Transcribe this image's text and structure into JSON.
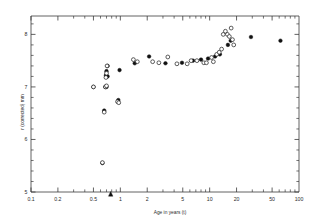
{
  "chart_data": {
    "type": "scatter",
    "title": "",
    "xlabel": "Age in years (t)",
    "ylabel": "r (corrected) mm",
    "xscale": "log",
    "yscale": "linear",
    "xlim": [
      0.1,
      100
    ],
    "ylim": [
      5,
      8.35
    ],
    "grid": false,
    "legend": "none",
    "xticks_major": [
      0.1,
      0.2,
      0.5,
      1,
      2,
      5,
      10,
      20,
      50,
      100
    ],
    "xtick_labels": [
      "0.1",
      "0.2",
      "0.5",
      "1",
      "2",
      "5",
      "10",
      "20",
      "50",
      "100"
    ],
    "yticks_major": [
      5,
      6,
      7,
      8
    ],
    "ytick_labels": [
      "5",
      "6",
      "7",
      "8"
    ],
    "annotations": [
      {
        "name": "axis-arrow-marker",
        "type": "triangle",
        "x": 0.78,
        "y": 5.0,
        "note": "triangle marker on x-axis"
      }
    ],
    "series": [
      {
        "name": "filled",
        "marker": "filled-circle",
        "color": "#111111",
        "points": [
          [
            0.5,
            7.0
          ],
          [
            0.63,
            5.55
          ],
          [
            0.66,
            6.55
          ],
          [
            0.68,
            7.0
          ],
          [
            0.69,
            7.22
          ],
          [
            0.7,
            7.0
          ],
          [
            0.7,
            7.3
          ],
          [
            0.72,
            7.4
          ],
          [
            0.72,
            7.2
          ],
          [
            0.95,
            6.75
          ],
          [
            0.98,
            7.32
          ],
          [
            1.45,
            7.45
          ],
          [
            2.1,
            7.58
          ],
          [
            3.2,
            7.45
          ],
          [
            4.9,
            7.46
          ],
          [
            6.5,
            7.5
          ],
          [
            8.0,
            7.52
          ],
          [
            9.6,
            7.54
          ],
          [
            11.5,
            7.58
          ],
          [
            13.0,
            7.62
          ],
          [
            16.0,
            7.8
          ],
          [
            17.2,
            7.88
          ],
          [
            29.0,
            7.95
          ],
          [
            62.0,
            7.88
          ]
        ]
      },
      {
        "name": "open",
        "marker": "open-circle",
        "color": "#1a1a1a",
        "points": [
          [
            0.5,
            7.0
          ],
          [
            0.63,
            5.56
          ],
          [
            0.66,
            6.52
          ],
          [
            0.68,
            7.0
          ],
          [
            0.69,
            7.18
          ],
          [
            0.7,
            7.02
          ],
          [
            0.7,
            7.26
          ],
          [
            0.71,
            7.4
          ],
          [
            0.93,
            6.72
          ],
          [
            0.96,
            6.7
          ],
          [
            1.4,
            7.52
          ],
          [
            1.55,
            7.48
          ],
          [
            2.3,
            7.48
          ],
          [
            2.7,
            7.46
          ],
          [
            3.4,
            7.57
          ],
          [
            4.3,
            7.44
          ],
          [
            5.6,
            7.44
          ],
          [
            6.2,
            7.5
          ],
          [
            7.2,
            7.5
          ],
          [
            8.6,
            7.46
          ],
          [
            9.2,
            7.46
          ],
          [
            10.5,
            7.56
          ],
          [
            11.0,
            7.48
          ],
          [
            12.0,
            7.62
          ],
          [
            12.8,
            7.66
          ],
          [
            13.6,
            7.72
          ],
          [
            14.2,
            8.0
          ],
          [
            15.0,
            8.06
          ],
          [
            15.8,
            8.0
          ],
          [
            16.6,
            7.96
          ],
          [
            17.4,
            8.12
          ],
          [
            18.0,
            7.9
          ],
          [
            18.6,
            7.8
          ]
        ]
      }
    ]
  }
}
